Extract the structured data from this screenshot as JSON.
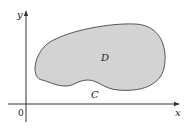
{
  "diagram": {
    "axes": {
      "x_label": "x",
      "y_label": "y",
      "origin_label": "0"
    },
    "region": {
      "label": "D",
      "fill": "#d3d3d3",
      "stroke": "#555555"
    },
    "curve": {
      "label": "C"
    }
  }
}
